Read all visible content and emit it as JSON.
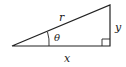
{
  "diagram": {
    "type": "right-triangle",
    "labels": {
      "hypotenuse": "r",
      "opposite": "y",
      "adjacent": "x",
      "angle": "θ"
    },
    "vertices": {
      "origin": [
        12,
        46
      ],
      "right_angle": [
        110,
        46
      ],
      "top": [
        110,
        5
      ]
    },
    "colors": {
      "stroke": "#222222",
      "background": "#ffffff"
    }
  }
}
